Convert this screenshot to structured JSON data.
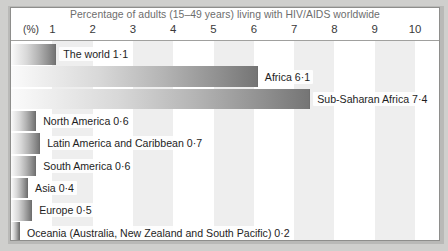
{
  "chart_data": {
    "type": "bar",
    "orientation": "horizontal",
    "title": "Percentage of adults (15–49 years) living with HIV/AIDS worldwide",
    "xlabel": "(%)",
    "ylabel": "",
    "xlim": [
      0,
      10.4
    ],
    "grid": "alternating vertical bands, one unit wide",
    "legend": "none",
    "tick_labels": [
      "1",
      "2",
      "3",
      "4",
      "5",
      "6",
      "7",
      "8",
      "9",
      "10"
    ],
    "tick_values": [
      1,
      2,
      3,
      4,
      5,
      6,
      7,
      8,
      9,
      10
    ],
    "categories": [
      "The world",
      "Africa",
      "Sub-Saharan Africa",
      "North America",
      "Latin America and Caribbean",
      "South America",
      "Asia",
      "Europe",
      "Oceania (Australia, New Zealand and South Pacific)"
    ],
    "values": [
      1.1,
      6.1,
      7.4,
      0.6,
      0.7,
      0.6,
      0.4,
      0.5,
      0.2
    ],
    "value_labels": [
      "1·1",
      "6·1",
      "7·4",
      "0·6",
      "0·7",
      "0·6",
      "0·4",
      "0·5",
      "0·2"
    ],
    "bars": [
      {
        "label": "The world 1·1",
        "category": "The world",
        "value": 1.1
      },
      {
        "label": "Africa  6·1",
        "category": "Africa",
        "value": 6.1
      },
      {
        "label": "Sub-Saharan Africa 7·4",
        "category": "Sub-Saharan Africa",
        "value": 7.4
      },
      {
        "label": "North America 0·6",
        "category": "North America",
        "value": 0.6
      },
      {
        "label": "Latin America and Caribbean 0·7",
        "category": "Latin America and Caribbean",
        "value": 0.7
      },
      {
        "label": "South America 0·6",
        "category": "South America",
        "value": 0.6
      },
      {
        "label": "Asia 0·4",
        "category": "Asia",
        "value": 0.4
      },
      {
        "label": "Europe 0·5",
        "category": "Europe",
        "value": 0.5
      },
      {
        "label": "Oceania (Australia, New Zealand and South Pacific) 0·2",
        "category": "Oceania (Australia, New Zealand and South Pacific)",
        "value": 0.2
      }
    ],
    "colors": {
      "bar_gradient_start": "#fbfbfb",
      "bar_gradient_end": "#757575",
      "band": "#eeeeee",
      "background": "#ffffff",
      "title_text": "#6d6d6d",
      "label_text": "#1d1d1d",
      "frame": "#8e8e8c",
      "page_background": "#cfcfcd"
    }
  }
}
